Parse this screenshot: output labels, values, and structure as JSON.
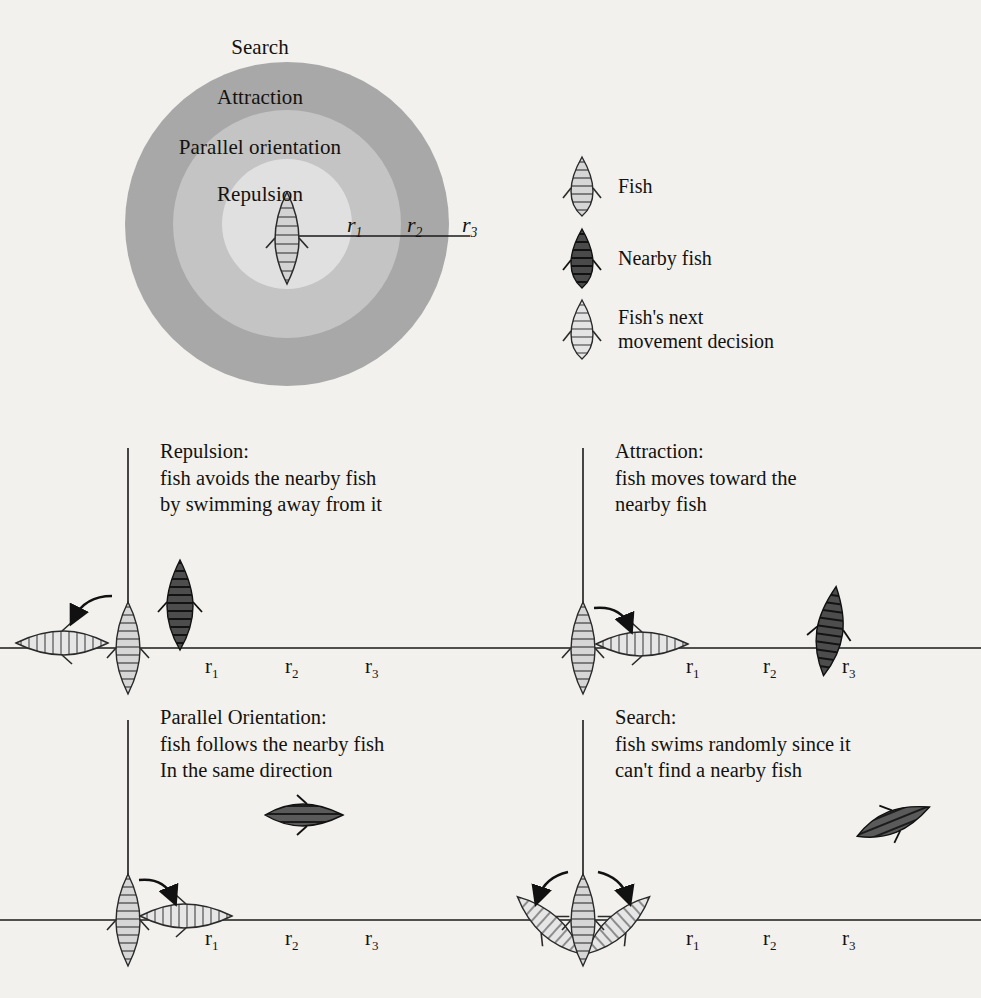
{
  "zone_diagram": {
    "name": "concentric-behavior-zones",
    "zones": [
      {
        "id": "search",
        "label": "Search",
        "fill": "#ffffff",
        "outer_radius_px": 180
      },
      {
        "id": "attraction",
        "label": "Attraction",
        "fill": "#a8a8a8",
        "outer_radius_px": 164
      },
      {
        "id": "parallel",
        "label": "Parallel orientation",
        "fill": "#c4c4c4",
        "outer_radius_px": 116
      },
      {
        "id": "repulsion",
        "label": "Repulsion",
        "fill": "#dedede",
        "outer_radius_px": 66
      }
    ],
    "radius_markers": [
      {
        "id": "r1",
        "label": "r",
        "subscript": "1"
      },
      {
        "id": "r2",
        "label": "r",
        "subscript": "2"
      },
      {
        "id": "r3",
        "label": "r",
        "subscript": "3"
      }
    ],
    "center_fish": "fish-icon"
  },
  "legend": {
    "items": [
      {
        "id": "fish",
        "glyph": "fish-striped-light-icon",
        "label": "Fish"
      },
      {
        "id": "nearby-fish",
        "glyph": "fish-dark-icon",
        "label": "Nearby fish"
      },
      {
        "id": "next-decision",
        "glyph": "fish-pale-icon",
        "label": "Fish's next\nmovement decision"
      }
    ]
  },
  "panels": [
    {
      "id": "repulsion",
      "title": "Repulsion:",
      "description": "fish avoids the nearby fish\nby swimming away from it",
      "caption": "Repulsion:\nfish avoids the nearby fish\nby swimming away from it",
      "tick_labels": [
        {
          "label": "r",
          "subscript": "1"
        },
        {
          "label": "r",
          "subscript": "2"
        },
        {
          "label": "r",
          "subscript": "3"
        }
      ]
    },
    {
      "id": "attraction",
      "title": "Attraction:",
      "description": "fish moves toward the\nnearby fish",
      "caption": "Attraction:\nfish moves toward the\nnearby fish",
      "tick_labels": [
        {
          "label": "r",
          "subscript": "1"
        },
        {
          "label": "r",
          "subscript": "2"
        },
        {
          "label": "r",
          "subscript": "3"
        }
      ]
    },
    {
      "id": "parallel",
      "title": "Parallel Orientation:",
      "description": "fish follows the nearby fish\nIn the same direction",
      "caption": "Parallel Orientation:\nfish follows the nearby fish\nIn the same direction",
      "tick_labels": [
        {
          "label": "r",
          "subscript": "1"
        },
        {
          "label": "r",
          "subscript": "2"
        },
        {
          "label": "r",
          "subscript": "3"
        }
      ]
    },
    {
      "id": "search",
      "title": "Search:",
      "description": "fish swims randomly since it\ncan't find a nearby fish",
      "caption": "Search:\nfish swims randomly since it\ncan't find a nearby fish",
      "tick_labels": [
        {
          "label": "r",
          "subscript": "1"
        },
        {
          "label": "r",
          "subscript": "2"
        },
        {
          "label": "r",
          "subscript": "3"
        }
      ]
    }
  ],
  "colors": {
    "page_background": "#f2f1ee",
    "zone_attraction": "#a8a8a8",
    "zone_parallel": "#c4c4c4",
    "zone_repulsion": "#dedede",
    "zone_search": "#ffffff",
    "fish_light": "#cfcfcf",
    "fish_dark": "#4a4a4a",
    "ink": "#14120f"
  }
}
